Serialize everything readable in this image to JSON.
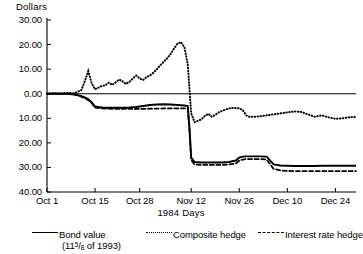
{
  "chart_data": {
    "type": "line",
    "title": "",
    "xlabel": "1984 Days",
    "ylabel": "Dollars",
    "ylim": [
      -40,
      30
    ],
    "xlim": [
      0,
      90
    ],
    "grid": false,
    "legend_position": "bottom",
    "ytick_labels": [
      "30.00",
      "20.00",
      "10.00",
      "0.00",
      "10.00",
      "20.00",
      "30.00",
      "40.00"
    ],
    "ytick_values": [
      30,
      20,
      10,
      0,
      -10,
      -20,
      -30,
      -40
    ],
    "xtick_labels": [
      "Oct 1",
      "Oct 15",
      "Oct 28",
      "Nov 12",
      "Nov 26",
      "Dec 10",
      "Dec 24"
    ],
    "xtick_values": [
      0,
      14,
      27,
      42,
      56,
      70,
      84
    ],
    "series": [
      {
        "name": "Bond value",
        "name_detail": "(11⅝ of 1993)",
        "style": "solid",
        "x": [
          0,
          2,
          4,
          6,
          8,
          9,
          10,
          11,
          12,
          13,
          14,
          16,
          18,
          20,
          22,
          24,
          26,
          27,
          28,
          30,
          32,
          34,
          36,
          38,
          40,
          41,
          41.5,
          42,
          43,
          45,
          47,
          49,
          51,
          53,
          55,
          56,
          57,
          58,
          60,
          62,
          64,
          66,
          68,
          70,
          72,
          74,
          76,
          78,
          80,
          82,
          84,
          86,
          88,
          90
        ],
        "y": [
          0,
          0,
          0,
          0,
          -0.3,
          -0.6,
          -1.0,
          -1.5,
          -2.2,
          -3.4,
          -5.2,
          -5.6,
          -5.7,
          -5.7,
          -5.7,
          -5.6,
          -5.4,
          -5.2,
          -5.0,
          -4.6,
          -4.4,
          -4.3,
          -4.4,
          -4.6,
          -4.8,
          -5.0,
          -14.0,
          -26.0,
          -27.8,
          -28.0,
          -28.0,
          -28.0,
          -28.0,
          -27.8,
          -27.2,
          -26.0,
          -25.6,
          -25.5,
          -25.5,
          -25.5,
          -25.6,
          -28.8,
          -29.2,
          -29.3,
          -29.4,
          -29.4,
          -29.4,
          -29.4,
          -29.3,
          -29.3,
          -29.3,
          -29.3,
          -29.3,
          -29.3
        ]
      },
      {
        "name": "Composite hedge",
        "style": "dotted",
        "x": [
          0,
          2,
          4,
          6,
          8,
          10,
          11,
          12,
          13,
          14,
          15,
          16,
          17,
          18,
          19,
          20,
          21,
          22,
          23,
          24,
          25,
          26,
          27,
          28,
          29,
          30,
          31,
          32,
          33,
          34,
          35,
          36,
          37,
          38,
          39,
          40,
          41,
          41.5,
          42,
          43,
          44,
          45,
          46,
          47,
          48,
          49,
          50,
          51,
          52,
          53,
          54,
          55,
          56,
          57,
          58,
          59,
          60,
          62,
          64,
          66,
          68,
          70,
          72,
          74,
          76,
          78,
          80,
          82,
          84,
          86,
          88,
          90
        ],
        "y": [
          0,
          0.2,
          0.1,
          0.3,
          0.2,
          1.5,
          5.0,
          9.2,
          4.3,
          1.8,
          2.5,
          3.2,
          3.4,
          4.6,
          3.6,
          4.6,
          5.8,
          5.0,
          4.0,
          4.8,
          6.2,
          7.4,
          6.2,
          5.6,
          6.8,
          7.4,
          8.6,
          10.0,
          11.6,
          13.0,
          14.4,
          16.2,
          18.4,
          20.4,
          21.0,
          19.0,
          12.0,
          2.0,
          -8.0,
          -11.6,
          -11.0,
          -10.4,
          -9.0,
          -8.2,
          -9.4,
          -8.6,
          -7.6,
          -7.0,
          -6.4,
          -6.0,
          -5.8,
          -5.8,
          -6.0,
          -6.6,
          -8.8,
          -9.4,
          -9.4,
          -9.2,
          -8.8,
          -8.4,
          -8.0,
          -7.6,
          -7.2,
          -7.4,
          -8.4,
          -9.4,
          -8.8,
          -9.6,
          -10.2,
          -10.0,
          -9.6,
          -9.4
        ]
      },
      {
        "name": "Interest rate hedge",
        "style": "dashed",
        "x": [
          0,
          2,
          4,
          6,
          8,
          9,
          10,
          11,
          12,
          13,
          14,
          16,
          18,
          20,
          22,
          24,
          26,
          28,
          30,
          32,
          34,
          36,
          38,
          40,
          41,
          41.5,
          42,
          43,
          45,
          47,
          49,
          51,
          53,
          55,
          56,
          57,
          58,
          60,
          62,
          64,
          66,
          68,
          70,
          72,
          74,
          76,
          78,
          80,
          82,
          84,
          86,
          88,
          90
        ],
        "y": [
          0,
          0,
          0,
          0,
          -0.3,
          -0.8,
          -1.2,
          -1.8,
          -2.6,
          -3.8,
          -5.6,
          -6.0,
          -6.1,
          -6.2,
          -6.2,
          -6.2,
          -6.2,
          -6.2,
          -6.1,
          -6.1,
          -6.0,
          -6.0,
          -6.0,
          -6.0,
          -6.0,
          -15.0,
          -27.0,
          -28.8,
          -29.0,
          -29.0,
          -29.0,
          -29.0,
          -28.8,
          -28.4,
          -27.2,
          -26.8,
          -26.6,
          -26.6,
          -26.6,
          -26.8,
          -30.6,
          -31.2,
          -31.4,
          -31.5,
          -31.5,
          -31.5,
          -31.5,
          -31.5,
          -31.5,
          -31.5,
          -31.5,
          -31.5,
          -31.5
        ]
      }
    ]
  },
  "legend": {
    "items": [
      {
        "label": "Bond value",
        "sub_label": "",
        "style": "solid"
      },
      {
        "label": "Composite hedge",
        "sub_label": "",
        "style": "dotted"
      },
      {
        "label": "Interest rate hedge",
        "sub_label": "",
        "style": "dashed"
      }
    ],
    "bond_sub_prefix": "(11",
    "bond_sub_num": "5",
    "bond_sub_den": "8",
    "bond_sub_suffix": " of 1993)"
  }
}
